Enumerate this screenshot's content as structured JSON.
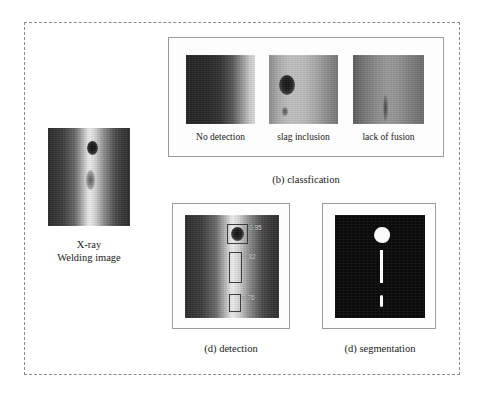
{
  "figure": {
    "source": {
      "caption": "X-ray\nWelding image",
      "image_name": "xray-welding-image"
    },
    "classification": {
      "caption": "(b) classfication",
      "thumbnails": [
        {
          "label": "No detection",
          "image_name": "weld-thumb-no-detection"
        },
        {
          "label": "slag inclusion",
          "image_name": "weld-thumb-slag-inclusion"
        },
        {
          "label": "lack of fusion",
          "image_name": "weld-thumb-lack-of-fusion"
        }
      ]
    },
    "detection": {
      "caption": "(d) detection",
      "image_name": "weld-detection-image",
      "boxes": [
        {
          "score": "0.95"
        },
        {
          "score": "0.82"
        },
        {
          "score": "0.76"
        }
      ]
    },
    "segmentation": {
      "caption": "(d) segmentation",
      "image_name": "weld-segmentation-mask"
    }
  },
  "colors": {
    "page_background": "#ffffff",
    "dashed_border": "#8a8a8a",
    "panel_border": "#9a9a9a",
    "text": "#1a1a1a",
    "mask_background": "#0a0a0a",
    "mask_foreground": "#fafafa",
    "detection_box_stroke": "#3a3a3a",
    "detection_score_text": "#e8e8e8"
  }
}
